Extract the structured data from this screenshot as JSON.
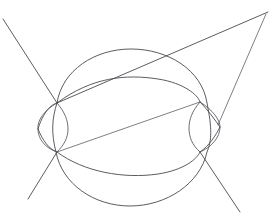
{
  "figure": {
    "background_color": "#ffffff",
    "stroke_color": "#4a4a4f",
    "canvas": {
      "width": 273,
      "height": 219
    },
    "nodes": [
      {
        "name": "upper-left-node",
        "x": 57,
        "y": 103
      },
      {
        "name": "upper-right-node",
        "x": 200,
        "y": 102
      },
      {
        "name": "lower-left-node",
        "x": 57,
        "y": 152
      },
      {
        "name": "lower-right-node",
        "x": 200,
        "y": 152
      }
    ],
    "shapes": [
      {
        "name": "large-circle",
        "type": "ellipse",
        "cx": 129,
        "cy": 128,
        "rx": 101,
        "ry": 78,
        "path": "M 57 103 C 62 70, 95 49, 131 49 C 168 49, 202 70, 207 103 C 212 128, 212 140, 207 152 C 200 184, 166 206, 130 206 C 94 206, 62 184, 56 152 C 51 133, 52 118, 57 103 Z"
      },
      {
        "name": "horizontal-lens-upper-arc",
        "type": "arc",
        "from": [
          40,
          128
        ],
        "to": [
          220,
          127
        ],
        "path": "M 38 129 C 45 106, 56 103, 57 103 C 92 77, 126 74, 158 79 C 184 83, 198 95, 200 102 C 208 110, 215 120, 220 127"
      },
      {
        "name": "horizontal-lens-lower-arc",
        "type": "arc",
        "from": [
          40,
          128
        ],
        "to": [
          220,
          127
        ],
        "path": "M 38 129 C 43 141, 49 149, 57 152 C 84 172, 124 179, 158 174 C 184 170, 197 159, 200 152 C 209 146, 216 135, 220 127"
      },
      {
        "name": "left-vertical-lens-outer-arc",
        "type": "arc",
        "path": "M 57 103 C 44 110, 37 121, 38 129 C 38 139, 45 148, 57 152"
      },
      {
        "name": "left-vertical-lens-inner-arc",
        "type": "arc",
        "path": "M 57 103 C 65 112, 68 121, 68 129 C 68 138, 64 145, 57 152"
      },
      {
        "name": "right-vertical-lens-outer-arc",
        "type": "arc",
        "path": "M 200 102 C 213 110, 220 120, 220 127 C 220 137, 212 147, 200 152"
      },
      {
        "name": "right-vertical-lens-inner-arc",
        "type": "arc",
        "path": "M 200 102 C 192 111, 189 120, 189 128 C 189 137, 192 145, 200 152"
      },
      {
        "name": "upper-left-diagonal-line",
        "type": "line",
        "from": [
          3,
          19
        ],
        "to": [
          57,
          103
        ]
      },
      {
        "name": "lower-left-diagonal-line",
        "type": "line",
        "from": [
          57,
          152
        ],
        "to": [
          28,
          199
        ]
      },
      {
        "name": "upper-right-diagonal-line-outer",
        "type": "line",
        "from": [
          57,
          103
        ],
        "to": [
          268,
          12
        ]
      },
      {
        "name": "upper-right-diagonal-line-inner",
        "type": "line",
        "from": [
          266,
          14
        ],
        "to": [
          218,
          125
        ]
      },
      {
        "name": "lower-right-diagonal-line",
        "type": "line",
        "from": [
          200,
          152
        ],
        "to": [
          240,
          212
        ]
      },
      {
        "name": "lower-left-to-right-crossing-line",
        "type": "line",
        "from": [
          57,
          152
        ],
        "to": [
          200,
          102
        ]
      }
    ]
  }
}
